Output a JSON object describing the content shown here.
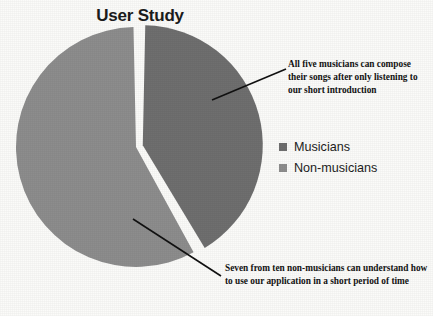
{
  "chart_data": {
    "type": "pie",
    "title": "User Study",
    "categories": [
      "Musicians",
      "Non-musicians"
    ],
    "values": [
      41.7,
      58.3
    ],
    "colors": [
      "#6f6f6f",
      "#8d8d8d"
    ],
    "exploded": [
      "Musicians"
    ],
    "legend_position": "right",
    "grid": false,
    "annotations": [
      {
        "target": "Musicians",
        "text": "All five musicians can compose their songs after only listening to our short introduction"
      },
      {
        "target": "Non-musicians",
        "text": "Seven from ten non-musicians can understand how to use our application in a short period of time"
      }
    ]
  },
  "figure": {
    "title": "User Study",
    "background_color": "#fbfbf9",
    "leader_line_color": "#111111"
  },
  "legend": {
    "items": [
      {
        "label": "Musicians",
        "color": "#6f6f6f"
      },
      {
        "label": "Non-musicians",
        "color": "#8d8d8d"
      }
    ]
  },
  "annotations": {
    "musicians": "All five musicians can compose their songs after only listening to our short introduction",
    "nonmusicians": "Seven from ten non-musicians can understand how to use our application in a short period of time"
  }
}
